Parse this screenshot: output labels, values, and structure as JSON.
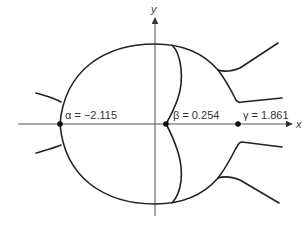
{
  "diagram": {
    "title": "",
    "axes": {
      "x_label": "x",
      "y_label": "y"
    },
    "points": [
      {
        "name": "alpha",
        "label": "α = −2.115",
        "value": -2.115
      },
      {
        "name": "beta",
        "label": "β = 0.254",
        "value": 0.254
      },
      {
        "name": "gamma",
        "label": "γ = 1.861",
        "value": 1.861
      }
    ],
    "colors": {
      "curve": "#222222",
      "axis": "#555555",
      "background": "#ffffff"
    }
  }
}
